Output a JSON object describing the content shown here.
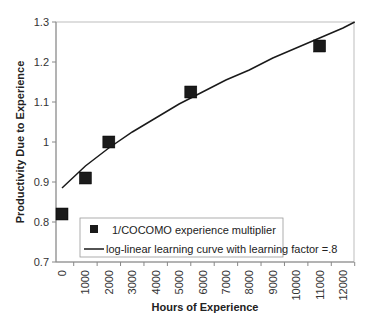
{
  "chart_data": {
    "type": "scatter",
    "title": "",
    "xlabel": "Hours of Experience",
    "ylabel": "Productivity Due to Experience",
    "xlim": [
      -250,
      12500
    ],
    "ylim": [
      0.7,
      1.3
    ],
    "x_ticks": [
      "0",
      "1000",
      "2000",
      "3000",
      "4000",
      "5000",
      "6000",
      "7000",
      "8000",
      "9000",
      "10000",
      "11000",
      "12000"
    ],
    "y_ticks": [
      "0.7",
      "0.8",
      "0.9",
      "1",
      "1.1",
      "1.2",
      "1.3"
    ],
    "grid": false,
    "legend_position": "lower-inside",
    "series": [
      {
        "name": "1/COCOMO experience multiplier",
        "type": "scatter",
        "marker": "square",
        "color": "#1a1a1a",
        "x": [
          0,
          1000,
          2000,
          5500,
          11000
        ],
        "y": [
          0.82,
          0.91,
          1.0,
          1.125,
          1.24
        ]
      },
      {
        "name": "log-linear learning curve with learning factor =.8",
        "type": "line",
        "color": "#1a1a1a",
        "x": [
          0,
          1000,
          2000,
          3000,
          4000,
          5000,
          6000,
          7000,
          8000,
          9000,
          10000,
          11000,
          12000,
          12500
        ],
        "y": [
          0.885,
          0.94,
          0.985,
          1.025,
          1.06,
          1.095,
          1.125,
          1.155,
          1.18,
          1.21,
          1.235,
          1.26,
          1.285,
          1.3
        ]
      }
    ]
  }
}
